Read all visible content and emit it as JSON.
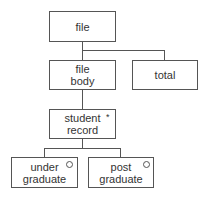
{
  "diagram": {
    "type": "jackson-structure-diagram",
    "nodes": {
      "file": {
        "label": "file"
      },
      "file_body": {
        "label_line1": "file",
        "label_line2": "body"
      },
      "total": {
        "label": "total"
      },
      "student_record": {
        "label_line1": "student",
        "label_line2": "record",
        "marker": "*"
      },
      "under_graduate": {
        "label_line1": "under",
        "label_line2": "graduate",
        "marker": "○"
      },
      "post_graduate": {
        "label_line1": "post",
        "label_line2": "graduate",
        "marker": "○"
      }
    },
    "edges": [
      [
        "file",
        "file_body"
      ],
      [
        "file",
        "total"
      ],
      [
        "file_body",
        "student_record"
      ],
      [
        "student_record",
        "under_graduate"
      ],
      [
        "student_record",
        "post_graduate"
      ]
    ]
  }
}
